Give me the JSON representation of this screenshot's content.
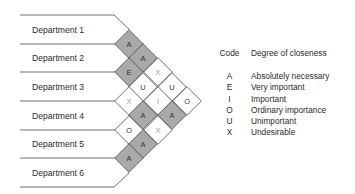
{
  "diagram": {
    "type": "relationship_chart",
    "departments": [
      "Department 1",
      "Department 2",
      "Department 3",
      "Department 4",
      "Department 5",
      "Department 6"
    ],
    "relationships": [
      {
        "pair": [
          1,
          2
        ],
        "code": "A"
      },
      {
        "pair": [
          1,
          3
        ],
        "code": "E"
      },
      {
        "pair": [
          2,
          3
        ],
        "code": "A"
      },
      {
        "pair": [
          2,
          4
        ],
        "code": "X"
      },
      {
        "pair": [
          3,
          4
        ],
        "code": "U"
      },
      {
        "pair": [
          2,
          5
        ],
        "code": "U"
      },
      {
        "pair": [
          3,
          5
        ],
        "code": "I"
      },
      {
        "pair": [
          4,
          5
        ],
        "code": "A"
      },
      {
        "pair": [
          1,
          4
        ],
        "code": "U"
      },
      {
        "pair": [
          1,
          5
        ],
        "code": "X"
      },
      {
        "pair": [
          1,
          6
        ],
        "code": "O"
      },
      {
        "pair": [
          2,
          6
        ],
        "code": "O"
      },
      {
        "pair": [
          3,
          6
        ],
        "code": "A"
      },
      {
        "pair": [
          4,
          6
        ],
        "code": "A"
      },
      {
        "pair": [
          5,
          6
        ],
        "code": "A"
      }
    ],
    "cells": [
      {
        "code": "A",
        "cx": 129,
        "cy": 44,
        "shaded": true
      },
      {
        "code": "A",
        "cx": 143,
        "cy": 58,
        "shaded": true
      },
      {
        "code": "E",
        "cx": 129,
        "cy": 72,
        "shaded": true
      },
      {
        "code": "X",
        "cx": 158,
        "cy": 72,
        "shaded": false
      },
      {
        "code": "U",
        "cx": 143,
        "cy": 87,
        "shaded": false
      },
      {
        "code": "U",
        "cx": 172,
        "cy": 87,
        "shaded": false
      },
      {
        "code": "X",
        "cx": 129,
        "cy": 101,
        "shaded": false
      },
      {
        "code": "I",
        "cx": 158,
        "cy": 101,
        "shaded": false
      },
      {
        "code": "O",
        "cx": 187,
        "cy": 101,
        "shaded": false
      },
      {
        "code": "A",
        "cx": 143,
        "cy": 115,
        "shaded": true
      },
      {
        "code": "A",
        "cx": 172,
        "cy": 115,
        "shaded": true
      },
      {
        "code": "O",
        "cx": 129,
        "cy": 130,
        "shaded": false
      },
      {
        "code": "X",
        "cx": 158,
        "cy": 130,
        "shaded": false
      },
      {
        "code": "A",
        "cx": 143,
        "cy": 144,
        "shaded": true
      },
      {
        "code": "A",
        "cx": 129,
        "cy": 158,
        "shaded": true
      }
    ]
  },
  "legend": {
    "header": {
      "code": "Code",
      "desc": "Degree of closeness"
    },
    "items": [
      {
        "code": "A",
        "desc": "Absolutely necessary"
      },
      {
        "code": "E",
        "desc": "Very important"
      },
      {
        "code": "I",
        "desc": "Important"
      },
      {
        "code": "O",
        "desc": "Ordinary importance"
      },
      {
        "code": "U",
        "desc": "Unimportant"
      },
      {
        "code": "X",
        "desc": "Undesirable"
      }
    ]
  },
  "colors": {
    "shaded": "#a9a9a9",
    "line": "#4a4a4a",
    "text": "#2a2a2a"
  }
}
